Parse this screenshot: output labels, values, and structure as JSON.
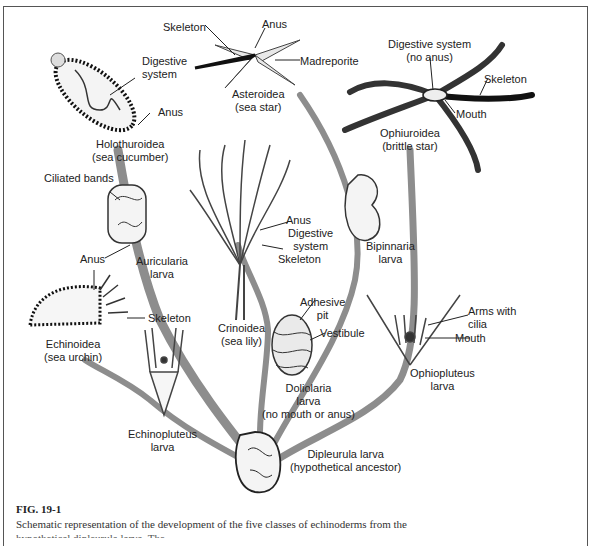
{
  "figure": {
    "number": "FIG. 19-1",
    "caption": "Schematic representation of the development of the five classes of echinoderms from the",
    "caption_cut": "hypothetical dipleurula larva. The ... "
  },
  "organisms": {
    "holothuroidea": {
      "name": "Holothuroidea",
      "common": "(sea cucumber)",
      "parts": [
        "Digestive",
        "system",
        "Anus"
      ]
    },
    "asteroidea": {
      "name": "Asteroidea",
      "common": "(sea star)",
      "parts": [
        "Skeleton",
        "Anus",
        "Madreporite"
      ]
    },
    "ophiuroidea": {
      "name": "Ophiuroidea",
      "common": "(brittle star)",
      "parts": [
        "Digestive system",
        "(no anus)",
        "Skeleton",
        "Mouth"
      ]
    },
    "crinoidea": {
      "name": "Crinoidea",
      "common": "(sea lily)",
      "parts": [
        "Anus",
        "Digestive",
        "system",
        "Skeleton"
      ]
    },
    "echinoidea": {
      "name": "Echinoidea",
      "common": "(sea urchin)",
      "parts": [
        "Anus",
        "Skeleton"
      ]
    }
  },
  "larvae": {
    "auricularia": {
      "line1": "Auricularia",
      "line2": "larva",
      "part": "Ciliated bands"
    },
    "bipinnaria": {
      "line1": "Bipinnaria",
      "line2": "larva"
    },
    "doliolaria": {
      "line1": "Doliolaria",
      "line2": "larva",
      "line3": "(no mouth or anus)",
      "parts": [
        "Adhesive",
        "pit",
        "Vestibule"
      ]
    },
    "ophiopluteus": {
      "line1": "Ophiopluteus",
      "line2": "larva",
      "parts": [
        "Arms with",
        "cilia",
        "Mouth"
      ]
    },
    "echinopluteus": {
      "line1": "Echinopluteus",
      "line2": "larva"
    },
    "dipleurula": {
      "line1": "Dipleurula larva",
      "line2": "(hypothetical ancestor)"
    }
  },
  "colors": {
    "stem": "#8a8a8a",
    "outline": "#222222",
    "fill": "#f2f2f2",
    "border": "#555555"
  }
}
